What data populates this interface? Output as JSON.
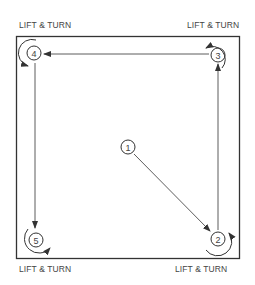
{
  "diagram": {
    "labels": {
      "top_left": "LIFT & TURN",
      "top_right": "LIFT & TURN",
      "bottom_left": "LIFT & TURN",
      "bottom_right": "LIFT & TURN"
    },
    "steps": [
      {
        "number": "1",
        "position": "center"
      },
      {
        "number": "2",
        "position": "bottom-right"
      },
      {
        "number": "3",
        "position": "top-right"
      },
      {
        "number": "4",
        "position": "top-left"
      },
      {
        "number": "5",
        "position": "bottom-left"
      }
    ],
    "path": [
      "1",
      "2",
      "3",
      "4",
      "5"
    ],
    "colors": {
      "line": "#333333",
      "text": "#444444",
      "background": "#ffffff"
    }
  }
}
